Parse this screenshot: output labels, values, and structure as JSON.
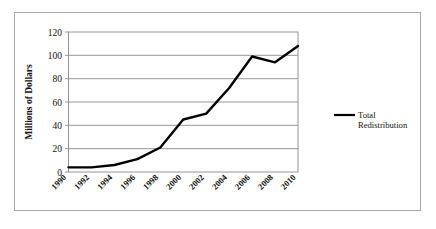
{
  "chart_data": {
    "type": "line",
    "title": "",
    "xlabel": "",
    "ylabel": "Millions of Dollars",
    "categories": [
      "1990",
      "1992",
      "1994",
      "1996",
      "1998",
      "2000",
      "2002",
      "2004",
      "2006",
      "2008",
      "2010"
    ],
    "x": [
      1990,
      1992,
      1994,
      1996,
      1998,
      2000,
      2002,
      2004,
      2006,
      2008,
      2010
    ],
    "series": [
      {
        "name": "Total Redistribution",
        "values": [
          4,
          4,
          6,
          11,
          21,
          45,
          50,
          72,
          99,
          94,
          108
        ],
        "color": "#000000"
      }
    ],
    "ylim": [
      0,
      120
    ],
    "yticks": [
      0,
      20,
      40,
      60,
      80,
      100,
      120
    ],
    "ytick_labels": [
      "0",
      "20",
      "40",
      "60",
      "80",
      "100",
      "120"
    ],
    "xlim": [
      1990,
      2010
    ],
    "grid": "horizontal",
    "legend_position": "right",
    "legend_entries": [
      {
        "label_line1": "Total",
        "label_line2": "Redistribution",
        "color": "#000000"
      }
    ]
  },
  "colors": {
    "line": "#000000",
    "gridline": "#8a8a8a",
    "frame": "#8a8a8a",
    "figure_border": "#a8a8a8",
    "background": "#ffffff",
    "text": "#111111"
  }
}
